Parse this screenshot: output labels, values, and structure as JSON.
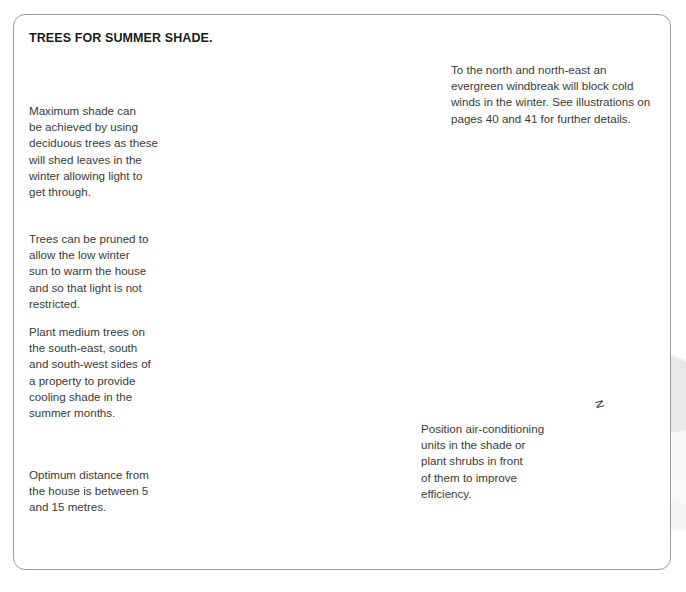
{
  "figure": {
    "title": "TREES FOR SUMMER SHADE.",
    "compass_label": "N"
  },
  "callouts": {
    "max_shade": {
      "name": "maximum-shade-note",
      "lines": [
        "Maximum shade can",
        "be achieved by using",
        "deciduous trees as these",
        "will shed leaves in the",
        "winter allowing light to",
        "get through."
      ]
    },
    "pruning": {
      "name": "pruning-note",
      "lines": [
        "Trees can be pruned to",
        "allow the low winter",
        "sun to warm the house",
        "and so that light is not",
        "restricted."
      ]
    },
    "medium_trees": {
      "name": "medium-trees-note",
      "lines": [
        "Plant medium trees on",
        "the south-east, south",
        "and south-west sides of",
        "a property to provide",
        "cooling shade in the",
        "summer months."
      ]
    },
    "optimum_distance": {
      "name": "optimum-distance-note",
      "lines": [
        "Optimum distance from",
        "the house is between 5",
        "and 15 metres."
      ]
    },
    "windbreak": {
      "name": "windbreak-note",
      "lines": [
        "To the north and north-east an",
        "evergreen windbreak will block cold",
        "winds in the winter. See illustrations on",
        "pages 40 and 41 for further details."
      ]
    },
    "air_conditioning": {
      "name": "air-conditioning-note",
      "lines": [
        "Position air-conditioning",
        "units in the shade or",
        "plant shrubs in front",
        "of them to improve",
        "efficiency."
      ]
    }
  },
  "colors": {
    "frame_border": "#9a9a9a",
    "text": "#3a3a3a",
    "title_text": "#1b1b1b",
    "leader_line": "#555555",
    "lawn": "#ffffff",
    "driveway": "#c9c9c9",
    "ground_shadow": "#d8d8d8",
    "roof": "#8a8a8a",
    "wall_light": "#f2f1ec",
    "wall_shaded": "#a8a8a8",
    "tree_foliage_dark": "#4f4f4f",
    "tree_foliage_mid": "#6e6e6e",
    "tree_foliage_light": "#9a9a9a",
    "conifer_dark": "#3f3f3f",
    "conifer_mid": "#7a7a7a",
    "trunk": "#464646",
    "shrub": "#5a5a5a",
    "ac_unit": "#dcdcdc"
  },
  "scene": {
    "elements": [
      {
        "name": "evergreen-windbreak",
        "label": "row of evergreen conifer trees"
      },
      {
        "name": "deciduous-tree-left",
        "label": "large deciduous shade tree"
      },
      {
        "name": "deciduous-tree-second",
        "label": "second deciduous shade tree"
      },
      {
        "name": "deciduous-tree-front",
        "label": "deciduous tree in front of house"
      },
      {
        "name": "house",
        "label": "two storey house with pitched roof"
      },
      {
        "name": "air-conditioning-unit",
        "label": "wall mounted air conditioning unit"
      },
      {
        "name": "driveway",
        "label": "curved driveway path"
      },
      {
        "name": "lawn",
        "label": "lawn area"
      },
      {
        "name": "shrubs",
        "label": "low planting shrubs"
      }
    ]
  }
}
